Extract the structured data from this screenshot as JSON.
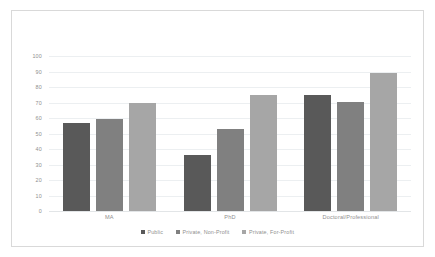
{
  "chart_data": {
    "type": "bar",
    "title": "",
    "subtitle": "",
    "xlabel": "",
    "ylabel": "",
    "categories": [
      "MA",
      "PhD",
      "Doctoral/Professional"
    ],
    "series": [
      {
        "name": "Public",
        "color": "#595959",
        "values": [
          56.5,
          36,
          75
        ]
      },
      {
        "name": "Private, Non-Profit",
        "color": "#808080",
        "values": [
          59.5,
          53,
          70.5
        ]
      },
      {
        "name": "Private, For-Profit",
        "color": "#a6a6a6",
        "values": [
          70,
          75,
          89
        ]
      }
    ],
    "ylim": [
      0,
      100
    ],
    "y_ticks": [
      0,
      10,
      20,
      30,
      40,
      50,
      60,
      70,
      80,
      90,
      100
    ],
    "grid": true,
    "legend_position": "bottom",
    "annotations": []
  },
  "style": {
    "plot_background": "#ffffff",
    "frame_border": "#d9d9d9",
    "gridline_color": "#eceff1",
    "tick_label_color": "#8f8f8f"
  }
}
